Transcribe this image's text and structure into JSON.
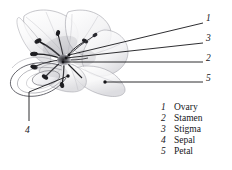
{
  "figure": {
    "background_color": "#ffffff",
    "ink_color": "#16161a"
  },
  "callouts": [
    {
      "id": "c1",
      "number": "1",
      "refers_to": "Ovary",
      "label_x": 208,
      "label_y": 19,
      "line_x1": 69,
      "line_y1": 55,
      "line_x2": 203,
      "line_y2": 23
    },
    {
      "id": "c3",
      "number": "3",
      "refers_to": "Stigma",
      "label_x": 208,
      "label_y": 39,
      "line_x1": 66,
      "line_y1": 58,
      "line_x2": 203,
      "line_y2": 43
    },
    {
      "id": "c2",
      "number": "2",
      "refers_to": "Stamen",
      "label_x": 208,
      "label_y": 58,
      "line_x1": 63,
      "line_y1": 62,
      "line_x2": 203,
      "line_y2": 62
    },
    {
      "id": "c5",
      "number": "5",
      "refers_to": "Petal",
      "label_x": 208,
      "label_y": 78,
      "line_x1": 105,
      "line_y1": 82,
      "line_x2": 203,
      "line_y2": 82
    },
    {
      "id": "c4",
      "number": "4",
      "refers_to": "Sepal",
      "label_x": 25,
      "label_y": 133,
      "line_x1": 68,
      "line_y1": 76,
      "line_x2": 29,
      "line_y2": 121
    }
  ],
  "legend": {
    "items": [
      {
        "number": "1",
        "label": "Ovary"
      },
      {
        "number": "2",
        "label": "Stamen"
      },
      {
        "number": "3",
        "label": "Stigma"
      },
      {
        "number": "4",
        "label": "Sepal"
      },
      {
        "number": "5",
        "label": "Petal"
      }
    ]
  }
}
